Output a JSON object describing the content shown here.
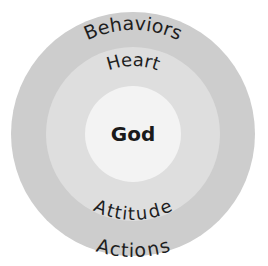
{
  "diagram": {
    "type": "concentric-circles",
    "colors": {
      "background": "#ffffff",
      "outer": "#cdcdcd",
      "middle": "#dedede",
      "inner": "#f3f3f3",
      "text": "#1e1e1e"
    },
    "center": {
      "label": "God"
    },
    "middle_ring": {
      "top_label": "Heart",
      "bottom_label": "Attitude"
    },
    "outer_ring": {
      "top_label": "Behaviors",
      "bottom_label": "Actions"
    }
  }
}
